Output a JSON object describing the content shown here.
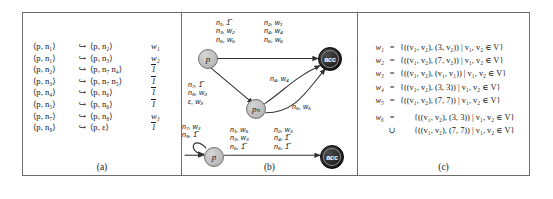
{
  "figure": {
    "panels": [
      {
        "id": "a",
        "caption": "(a)"
      },
      {
        "id": "b",
        "caption": "(b)"
      },
      {
        "id": "c",
        "caption": "(c)"
      }
    ]
  },
  "panel_a": {
    "title": "pushdown system rules",
    "rules": [
      {
        "lhs": "⟨p, n₁⟩",
        "arrow": "↪",
        "rhs": "⟨p, n₂⟩",
        "weight": "w₁",
        "weight_bar": false
      },
      {
        "lhs": "⟨p, n₁⟩",
        "arrow": "↪",
        "rhs": "⟨p, n₃⟩",
        "weight": "w₂",
        "weight_bar": false
      },
      {
        "lhs": "⟨p, n₂⟩",
        "arrow": "↪",
        "rhs": "⟨p, n₇ n₄⟩",
        "weight": "1",
        "weight_bar": true
      },
      {
        "lhs": "⟨p, n₃⟩",
        "arrow": "↪",
        "rhs": "⟨p, n₇ n₅⟩",
        "weight": "1",
        "weight_bar": true
      },
      {
        "lhs": "⟨p, n₄⟩",
        "arrow": "↪",
        "rhs": "⟨p, n₆⟩",
        "weight": "1",
        "weight_bar": true
      },
      {
        "lhs": "⟨p, n₅⟩",
        "arrow": "↪",
        "rhs": "⟨p, n₆⟩",
        "weight": "1",
        "weight_bar": true
      },
      {
        "lhs": "⟨p, n₇⟩",
        "arrow": "↪",
        "rhs": "⟨p, n₈⟩",
        "weight": "w₃",
        "weight_bar": false
      },
      {
        "lhs": "⟨p, n₈⟩",
        "arrow": "↪",
        "rhs": "⟨p, ε⟩",
        "weight": "1",
        "weight_bar": true
      }
    ]
  },
  "panel_b": {
    "nodes": [
      {
        "id": "p-top",
        "label": "p",
        "kind": "grey"
      },
      {
        "id": "acc-top",
        "label": "acc",
        "kind": "black"
      },
      {
        "id": "pn",
        "label": "pₙ",
        "kind": "grey"
      },
      {
        "id": "p-bottom",
        "label": "p",
        "kind": "grey"
      },
      {
        "id": "acc-bottom",
        "label": "acc",
        "kind": "black"
      }
    ],
    "edge_labels": {
      "top_left_col": [
        "n₁, 1̅",
        "n₃, w₂",
        "n₅, w₅"
      ],
      "top_right_col": [
        "n₂, w₁",
        "n₄, w₄",
        "n₆, w₆"
      ],
      "p_to_pn": [
        "n₇, 1̅",
        "n₈, w₃",
        "ε, w₃"
      ],
      "pn_curve_upper": "n₄, w₄",
      "pn_curve_lower": "n₅, w₅",
      "self_loop": [
        "n₇, w₃",
        "n₈, 1̅"
      ],
      "bottom_left_col": [
        "n₁, w₆",
        "n₃, w₃",
        "n₅, 1̅"
      ],
      "bottom_right_col": [
        "n₂, w₃",
        "n₄, 1̅",
        "n₆, 1̅"
      ]
    }
  },
  "panel_c": {
    "equations": [
      {
        "name": "w₁",
        "eq": "=",
        "body": "{((v₁, v₂), (3, v₂)) | v₁, v₂ ∈ V}"
      },
      {
        "name": "w₂",
        "eq": "=",
        "body": "{((v₁, v₂), (7, v₂)) | v₁, v₂ ∈ V}"
      },
      {
        "name": "w₃",
        "eq": "=",
        "body": "{((v₁, v₂), (v₁, v₁)) | v₁, v₂ ∈ V}"
      },
      {
        "name": "w₄",
        "eq": "=",
        "body": "{((v₁, v₂), (3, 3)) | v₁, v₂ ∈ V}"
      },
      {
        "name": "w₅",
        "eq": "=",
        "body": "{((v₁, v₂), (7, 7)) | v₁, v₂ ∈ V}"
      }
    ],
    "last": {
      "name": "w₆",
      "eq": "=",
      "line1": "{((v₁, v₂), (3, 3)) | v₁, v₂ ∈ V}",
      "cup": "∪",
      "line2": "{((v₁, v₂), (7, 7)) | v₁, v₂ ∈ V}"
    }
  }
}
